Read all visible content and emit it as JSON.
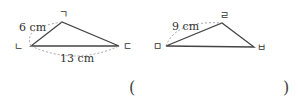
{
  "figure1": {
    "vertices": {
      "top": "ㄱ",
      "left": "ㄴ",
      "right": "ㄷ"
    },
    "side_labels": {
      "left_top": "6 cm",
      "left_right": "13 cm"
    }
  },
  "figure2": {
    "vertices": {
      "top": "ㄹ",
      "left": "ㅁ",
      "right": "ㅂ"
    },
    "side_labels": {
      "left_top": "9 cm"
    }
  },
  "answer": {
    "open": "(",
    "close": ")",
    "value": ""
  },
  "colors": {
    "line": "#444444",
    "dash": "#999999",
    "text": "#333333"
  }
}
